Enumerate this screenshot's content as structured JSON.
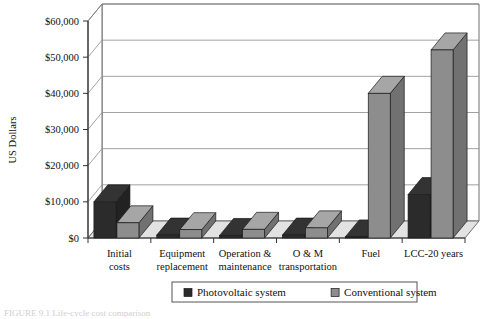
{
  "chart_data": {
    "type": "bar",
    "title": "",
    "xlabel": "",
    "ylabel": "US Dollars",
    "ylim": [
      0,
      60000
    ],
    "ytick_values": [
      0,
      10000,
      20000,
      30000,
      40000,
      50000,
      60000
    ],
    "ytick_labels": [
      "$0",
      "$10,000",
      "$20,000",
      "$30,000",
      "$40,000",
      "$50,000",
      "$60,000"
    ],
    "grid": true,
    "legend_position": "bottom",
    "projection": "3d-bar",
    "categories": [
      "Initial costs",
      "Equipment replacement",
      "Operation & maintenance",
      "O & M transportation",
      "Fuel",
      "LCC-20 years"
    ],
    "category_lines": [
      [
        "Initial",
        "costs"
      ],
      [
        "Equipment",
        "replacement"
      ],
      [
        "Operation &",
        "maintenance"
      ],
      [
        "O & M",
        "transportation"
      ],
      [
        "Fuel",
        ""
      ],
      [
        "LCC-20 years",
        ""
      ]
    ],
    "series": [
      {
        "name": "Photovoltaic system",
        "color": "#2b2b2b",
        "values": [
          10000,
          800,
          700,
          800,
          300,
          12000
        ]
      },
      {
        "name": "Conventional system",
        "color": "#8d8d8d",
        "values": [
          4200,
          2300,
          2400,
          2800,
          40000,
          52000
        ]
      }
    ]
  },
  "legend": {
    "items": [
      {
        "label": "Photovoltaic system",
        "swatch": "#2b2b2b"
      },
      {
        "label": "Conventional system",
        "swatch": "#8d8d8d"
      }
    ]
  },
  "axis": {
    "y_title": "US Dollars"
  },
  "colors": {
    "series_dark": "#2b2b2b",
    "series_light": "#8d8d8d",
    "floor": "#e2e2e2",
    "wall": "#ffffff",
    "gridline": "#8a8a8a",
    "axis": "#6f6f6f"
  },
  "caption": {
    "partial_text": "FIGURE 9.1  Life-cycle cost comparison"
  }
}
